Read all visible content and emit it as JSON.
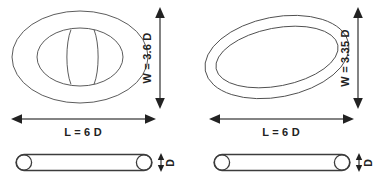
{
  "figure": {
    "background_color": "#ffffff",
    "line_color": "#4a4a4a",
    "dimension_color": "#222222"
  },
  "panels": [
    {
      "id": "left",
      "name": "oblong-ring-top-view",
      "shape": "oblong ring with flattened waist",
      "dimensions": {
        "width_label": "W = 3.6 D",
        "length_label": "L = 6 D",
        "thickness_label": "D"
      }
    },
    {
      "id": "right",
      "name": "circular-ring-top-view",
      "shape": "tilted annular ring",
      "dimensions": {
        "width_label": "W = 3.35 D",
        "length_label": "L = 6 D",
        "thickness_label": "D"
      }
    }
  ],
  "labels": {
    "left_width": "W = 3.6 D",
    "left_length": "L = 6 D",
    "left_thickness": "D",
    "right_width": "W = 3.35 D",
    "right_length": "L = 6 D",
    "right_thickness": "D"
  }
}
